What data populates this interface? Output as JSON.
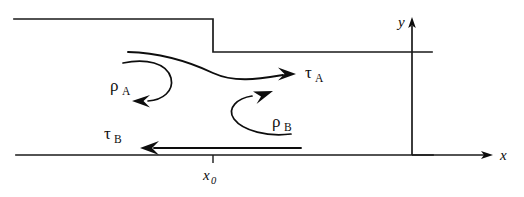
{
  "figure": {
    "type": "diagram",
    "labels": {
      "rho_a_symbol": "ρ",
      "rho_a_subscript": "A",
      "rho_b_symbol": "ρ",
      "rho_b_subscript": "B",
      "tau_a_symbol": "τ",
      "tau_a_subscript": "A",
      "tau_b_symbol": "τ",
      "tau_b_subscript": "B",
      "x_axis": "x",
      "y_axis": "y",
      "x_origin_symbol": "x",
      "x_origin_subscript": "0"
    },
    "colors": {
      "stroke": "#1a1a1a",
      "curve": "#0d0d0d",
      "background": "#ffffff"
    },
    "geometry": {
      "upper_wall_left_x": 14,
      "upper_wall_y": 19,
      "step_x": 213,
      "step_bottom_y": 52,
      "upper_wall_right_x": 432,
      "lower_wall_left_x": 16,
      "lower_wall_y": 155,
      "lower_wall_right_x": 433,
      "y_axis_x": 412,
      "y_axis_top_y": 20,
      "x_axis_right_x": 492
    }
  }
}
